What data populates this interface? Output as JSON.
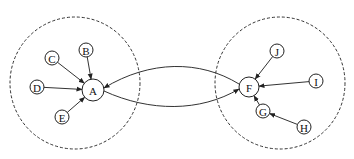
{
  "diagram": {
    "clusters": [
      {
        "id": "left",
        "cx": 75,
        "cy": 83,
        "rx": 65,
        "ry": 66
      },
      {
        "id": "right",
        "cx": 280,
        "cy": 83,
        "rx": 65,
        "ry": 66
      }
    ],
    "nodes": [
      {
        "id": "A",
        "label": "A",
        "x": 93,
        "y": 90,
        "r": 11
      },
      {
        "id": "B",
        "label": "B",
        "x": 86,
        "y": 50,
        "r": 7
      },
      {
        "id": "C",
        "label": "C",
        "x": 52,
        "y": 58,
        "r": 7
      },
      {
        "id": "D",
        "label": "D",
        "x": 37,
        "y": 87,
        "r": 7
      },
      {
        "id": "E",
        "label": "E",
        "x": 62,
        "y": 117,
        "r": 7
      },
      {
        "id": "F",
        "label": "F",
        "x": 249,
        "y": 87,
        "r": 10
      },
      {
        "id": "J",
        "label": "J",
        "x": 277,
        "y": 51,
        "r": 7
      },
      {
        "id": "I",
        "label": "I",
        "x": 316,
        "y": 81,
        "r": 7
      },
      {
        "id": "G",
        "label": "G",
        "x": 263,
        "y": 111,
        "r": 7
      },
      {
        "id": "H",
        "label": "H",
        "x": 304,
        "y": 127,
        "r": 7
      }
    ],
    "edges": [
      {
        "from": "B",
        "to": "A"
      },
      {
        "from": "C",
        "to": "A"
      },
      {
        "from": "D",
        "to": "A"
      },
      {
        "from": "E",
        "to": "A"
      },
      {
        "from": "F",
        "to": "A",
        "curved": true
      },
      {
        "from": "A",
        "to": "F",
        "curved": true
      },
      {
        "from": "J",
        "to": "F"
      },
      {
        "from": "I",
        "to": "F"
      },
      {
        "from": "G",
        "to": "F"
      },
      {
        "from": "H",
        "to": "G"
      }
    ]
  }
}
